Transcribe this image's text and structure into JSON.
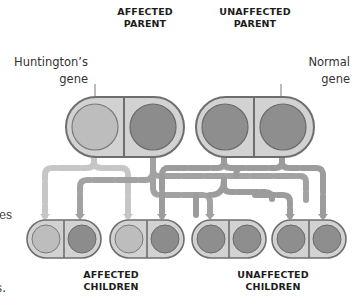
{
  "headings": {
    "affected_parent": [
      "AFFECTED",
      "PARENT"
    ],
    "unaffected_parent": [
      "UNAFFECTED",
      "PARENT"
    ],
    "affected_children": [
      "AFFECTED",
      "CHILDREN"
    ],
    "unaffected_children": [
      "UNAFFECTED",
      "CHILDREN"
    ]
  },
  "labels": {
    "huntingtons_gene": [
      "Huntington’s",
      "gene"
    ],
    "normal_gene": [
      "Normal",
      "gene"
    ]
  },
  "fragments": {
    "left_text_1": "es",
    "left_text_2": "s."
  },
  "colors": {
    "capsule_fill": "#d2d2d2",
    "capsule_stroke": "#6e6e6e",
    "huntington_allele": "#bdbdbd",
    "normal_allele": "#8c8c8c",
    "arrow_from_affected": "#c2c2c2",
    "arrow_from_unaffected": "#9a9a9a"
  },
  "parents": [
    {
      "id": "affected",
      "alleles": [
        "huntington",
        "normal"
      ]
    },
    {
      "id": "unaffected",
      "alleles": [
        "normal",
        "normal"
      ]
    }
  ],
  "children": [
    {
      "group": "affected",
      "alleles": [
        "huntington",
        "normal"
      ]
    },
    {
      "group": "affected",
      "alleles": [
        "huntington",
        "normal"
      ]
    },
    {
      "group": "unaffected",
      "alleles": [
        "normal",
        "normal"
      ]
    },
    {
      "group": "unaffected",
      "alleles": [
        "normal",
        "normal"
      ]
    }
  ]
}
